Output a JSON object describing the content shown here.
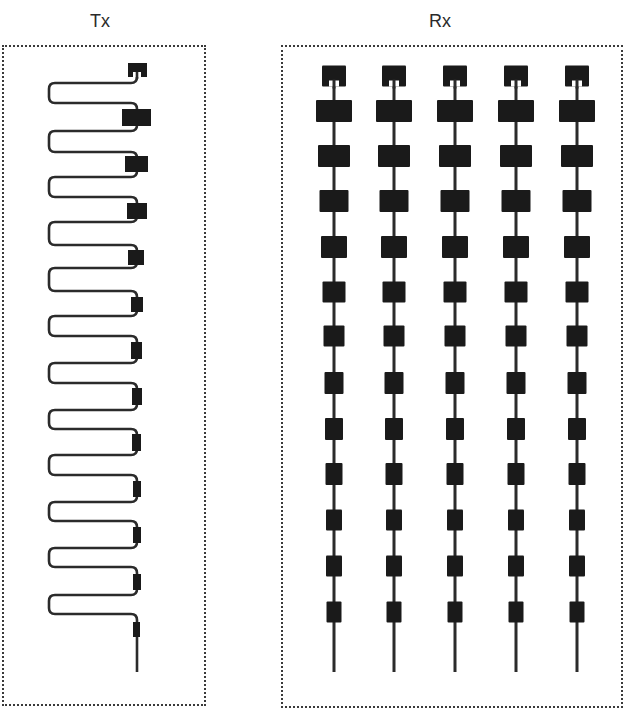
{
  "labels": {
    "tx": "Tx",
    "rx": "Rx"
  },
  "colors": {
    "ink": "#1a1a1a",
    "line": "#2b2b2b",
    "border": "#3a3a3a",
    "background": "#ffffff"
  },
  "tx_array": {
    "type": "serpentine-fed series patch array",
    "feed_x": 137,
    "left_x": 49,
    "turn_radius": 6,
    "line_width": 2.6,
    "start_y": 70,
    "tail_end_y": 672,
    "loops": [
      {
        "top_y": 83,
        "bottom_y": 103
      },
      {
        "top_y": 131,
        "bottom_y": 152
      },
      {
        "top_y": 177,
        "bottom_y": 197
      },
      {
        "top_y": 222,
        "bottom_y": 245
      },
      {
        "top_y": 268,
        "bottom_y": 291
      },
      {
        "top_y": 316,
        "bottom_y": 336
      },
      {
        "top_y": 363,
        "bottom_y": 383
      },
      {
        "top_y": 410,
        "bottom_y": 429
      },
      {
        "top_y": 455,
        "bottom_y": 475
      },
      {
        "top_y": 502,
        "bottom_y": 521
      },
      {
        "top_y": 548,
        "bottom_y": 567
      },
      {
        "top_y": 595,
        "bottom_y": 614
      }
    ],
    "patches": [
      {
        "x": 128,
        "y": 63,
        "w": 19,
        "h": 14,
        "notch": true
      },
      {
        "x": 122,
        "y": 109,
        "w": 29,
        "h": 17
      },
      {
        "x": 125,
        "y": 156,
        "w": 23,
        "h": 16
      },
      {
        "x": 127,
        "y": 203,
        "w": 20,
        "h": 16
      },
      {
        "x": 128,
        "y": 250,
        "w": 16,
        "h": 15
      },
      {
        "x": 131,
        "y": 297,
        "w": 12,
        "h": 15
      },
      {
        "x": 131,
        "y": 342,
        "w": 11,
        "h": 17
      },
      {
        "x": 132,
        "y": 388,
        "w": 10,
        "h": 17
      },
      {
        "x": 132,
        "y": 434,
        "w": 9,
        "h": 17
      },
      {
        "x": 133,
        "y": 481,
        "w": 8,
        "h": 16
      },
      {
        "x": 133,
        "y": 527,
        "w": 8,
        "h": 16
      },
      {
        "x": 133,
        "y": 574,
        "w": 8,
        "h": 16
      },
      {
        "x": 133,
        "y": 622,
        "w": 7,
        "h": 15
      }
    ]
  },
  "rx_array": {
    "type": "5-column series-fed patch array",
    "column_centers_x": [
      334,
      394,
      455,
      516,
      577
    ],
    "line_top_y": 76,
    "line_bottom_y": 672,
    "line_width": 3,
    "patches": [
      {
        "cy": 76,
        "w": 24,
        "h": 21,
        "notch": true
      },
      {
        "cy": 111,
        "w": 36,
        "h": 22
      },
      {
        "cy": 156,
        "w": 32,
        "h": 22
      },
      {
        "cy": 201,
        "w": 29,
        "h": 22
      },
      {
        "cy": 247,
        "w": 26,
        "h": 22
      },
      {
        "cy": 292,
        "w": 23,
        "h": 21
      },
      {
        "cy": 336,
        "w": 21,
        "h": 21
      },
      {
        "cy": 383,
        "w": 19,
        "h": 22
      },
      {
        "cy": 429,
        "w": 18,
        "h": 22
      },
      {
        "cy": 474,
        "w": 17,
        "h": 22
      },
      {
        "cy": 520,
        "w": 16,
        "h": 21
      },
      {
        "cy": 566,
        "w": 16,
        "h": 21
      },
      {
        "cy": 612,
        "w": 15,
        "h": 21
      }
    ]
  }
}
